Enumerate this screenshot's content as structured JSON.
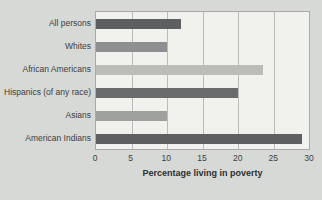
{
  "chart_data": {
    "type": "bar",
    "orientation": "horizontal",
    "title": "",
    "xlabel": "Percentage living in poverty",
    "ylabel": "",
    "categories": [
      "All persons",
      "Whites",
      "African Americans",
      "Hispanics (of any race)",
      "Asians",
      "American Indians"
    ],
    "values": [
      12,
      10,
      23.5,
      20,
      10,
      29
    ],
    "bar_colors": [
      "#5e5f61",
      "#8e8f91",
      "#bcbdb9",
      "#6a6b6d",
      "#9ea09d",
      "#5e5f61"
    ],
    "xlim": [
      0,
      30
    ],
    "xticks": [
      0,
      5,
      10,
      15,
      20,
      25,
      30
    ],
    "grid": "vertical",
    "legend": "none"
  },
  "colors": {
    "background": "#d6d9d5",
    "panel": "#f1f2ed",
    "panel_border": "#a8aba8",
    "gridline": "#b9bcb8",
    "text": "#3c3d3f"
  }
}
